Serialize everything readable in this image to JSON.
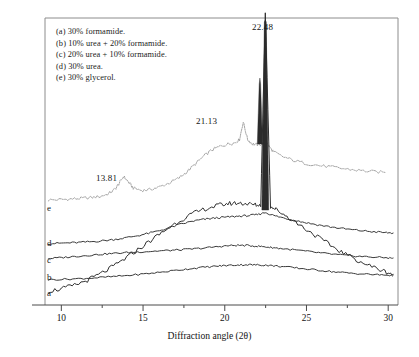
{
  "figure": {
    "background": "#ffffff",
    "frame_color": "#8c8c8c",
    "axis_color": "#4a4a4a"
  },
  "legend": {
    "entries": [
      "(a) 30% formamide.",
      "(b) 10% urea + 20% formamide.",
      "(c) 20% urea + 10% formamide.",
      "(d) 30% urea.",
      "(e) 30% glycerol."
    ]
  },
  "annotations": [
    {
      "id": "peak-2248",
      "text": "22.48"
    },
    {
      "id": "peak-2113",
      "text": "21.13"
    },
    {
      "id": "peak-1381",
      "text": "13.81"
    }
  ],
  "curve_labels": [
    "e",
    "d",
    "c",
    "b",
    "a"
  ],
  "chart_data": {
    "type": "line",
    "title": "",
    "xlabel": "Diffraction angle (2θ)",
    "ylabel": "",
    "xlim": [
      9.0,
      30.6
    ],
    "ylim": [
      0,
      1
    ],
    "grid": false,
    "legend_position": "top-left-inset",
    "xticks": [
      10,
      15,
      20,
      25,
      30
    ],
    "xticklabels": [
      "10",
      "15",
      "20",
      "25",
      "30"
    ],
    "minor_xticks": [
      12.5,
      17.5,
      22.5,
      27.5
    ],
    "yaxis_visible": false,
    "peak_annotations": [
      {
        "label": "13.81",
        "x": 13.81,
        "series": "e"
      },
      {
        "label": "21.13",
        "x": 21.13,
        "series": "e"
      },
      {
        "label": "22.48",
        "x": 22.48,
        "series": "a"
      }
    ],
    "series": [
      {
        "name": "e",
        "legend": "(e) 30% glycerol.",
        "style": "dotted",
        "color": "#9a9a9a",
        "offset_label": "e",
        "x": [
          9.2,
          10.0,
          10.6,
          11.2,
          11.8,
          12.4,
          12.9,
          13.3,
          13.55,
          13.81,
          14.1,
          14.4,
          14.9,
          15.4,
          16.0,
          16.6,
          17.2,
          17.7,
          18.2,
          18.7,
          19.2,
          19.7,
          20.2,
          20.6,
          20.9,
          21.13,
          21.4,
          21.7,
          22.0,
          22.3,
          22.48,
          22.7,
          23.0,
          23.5,
          24.2,
          25.0,
          25.8,
          26.6,
          27.4,
          28.2,
          29.0,
          29.8
        ],
        "y": [
          0.05,
          0.052,
          0.055,
          0.058,
          0.062,
          0.068,
          0.082,
          0.105,
          0.135,
          0.168,
          0.14,
          0.11,
          0.098,
          0.102,
          0.115,
          0.135,
          0.16,
          0.192,
          0.23,
          0.268,
          0.3,
          0.318,
          0.33,
          0.336,
          0.352,
          0.44,
          0.352,
          0.33,
          0.326,
          0.33,
          0.345,
          0.318,
          0.29,
          0.268,
          0.248,
          0.232,
          0.222,
          0.214,
          0.205,
          0.198,
          0.192,
          0.188
        ]
      },
      {
        "name": "d",
        "legend": "(d) 30% urea.",
        "style": "solid",
        "color": "#3a3a3a",
        "offset_label": "d",
        "x": [
          9.2,
          10.0,
          10.8,
          11.6,
          12.4,
          13.2,
          14.0,
          14.8,
          15.6,
          16.4,
          17.2,
          18.0,
          18.6,
          19.2,
          19.8,
          20.4,
          21.0,
          21.5,
          22.0,
          22.48,
          23.0,
          23.6,
          24.3,
          25.0,
          25.8,
          26.6,
          27.4,
          28.2,
          29.0,
          29.8,
          30.3
        ],
        "y": [
          0.028,
          0.032,
          0.036,
          0.042,
          0.05,
          0.062,
          0.078,
          0.098,
          0.122,
          0.152,
          0.186,
          0.214,
          0.228,
          0.238,
          0.246,
          0.252,
          0.258,
          0.262,
          0.27,
          0.288,
          0.262,
          0.242,
          0.222,
          0.202,
          0.182,
          0.165,
          0.15,
          0.138,
          0.128,
          0.12,
          0.116
        ]
      },
      {
        "name": "c",
        "legend": "(c) 20% urea + 10% formamide.",
        "style": "solid",
        "color": "#3a3a3a",
        "offset_label": "c",
        "x": [
          9.2,
          10.0,
          10.8,
          11.6,
          12.4,
          13.2,
          14.0,
          14.8,
          15.6,
          16.4,
          17.2,
          18.0,
          18.8,
          19.6,
          20.2,
          20.8,
          21.4,
          22.0,
          22.48,
          23.0,
          23.6,
          24.4,
          25.2,
          26.0,
          26.8,
          27.6,
          28.4,
          29.2,
          30.0,
          30.3
        ],
        "y": [
          0.05,
          0.058,
          0.068,
          0.078,
          0.088,
          0.096,
          0.104,
          0.11,
          0.116,
          0.122,
          0.128,
          0.136,
          0.146,
          0.158,
          0.166,
          0.17,
          0.168,
          0.162,
          0.156,
          0.148,
          0.138,
          0.126,
          0.112,
          0.098,
          0.086,
          0.076,
          0.068,
          0.062,
          0.056,
          0.054
        ]
      },
      {
        "name": "b",
        "legend": "(b) 10% urea + 20% formamide.",
        "style": "solid",
        "color": "#3a3a3a",
        "offset_label": "b",
        "x": [
          9.2,
          10.2,
          11.2,
          12.2,
          13.2,
          14.2,
          15.2,
          16.2,
          17.2,
          18.0,
          18.8,
          19.6,
          20.2,
          20.8,
          21.4,
          22.0,
          22.48,
          23.0,
          23.6,
          24.4,
          25.2,
          26.0,
          26.8,
          27.6,
          28.4,
          29.2,
          30.0,
          30.3
        ],
        "y": [
          0.012,
          0.016,
          0.022,
          0.03,
          0.04,
          0.052,
          0.066,
          0.082,
          0.1,
          0.114,
          0.126,
          0.136,
          0.142,
          0.146,
          0.148,
          0.146,
          0.144,
          0.138,
          0.13,
          0.118,
          0.106,
          0.094,
          0.082,
          0.072,
          0.064,
          0.058,
          0.052,
          0.05
        ]
      },
      {
        "name": "a",
        "legend": "(a) 30% formamide.",
        "style": "solid",
        "color": "#2e2e2e",
        "offset_label": "a",
        "has_sharp_peak": true,
        "sharp_peak_x": 22.48,
        "x": [
          9.2,
          10.0,
          10.8,
          11.6,
          12.4,
          13.2,
          14.0,
          14.8,
          15.6,
          16.4,
          17.2,
          18.0,
          18.8,
          19.6,
          20.2,
          20.8,
          21.3,
          21.8,
          22.2,
          22.48,
          22.8,
          23.2,
          23.8,
          24.6,
          25.4,
          26.2,
          27.0,
          27.8,
          28.6,
          29.4,
          30.0,
          30.3
        ],
        "y": [
          0.02,
          0.028,
          0.04,
          0.058,
          0.08,
          0.106,
          0.136,
          0.168,
          0.2,
          0.232,
          0.262,
          0.286,
          0.304,
          0.316,
          0.322,
          0.324,
          0.322,
          0.318,
          0.316,
          0.98,
          0.312,
          0.3,
          0.278,
          0.248,
          0.218,
          0.188,
          0.16,
          0.136,
          0.114,
          0.096,
          0.084,
          0.078
        ]
      }
    ]
  }
}
